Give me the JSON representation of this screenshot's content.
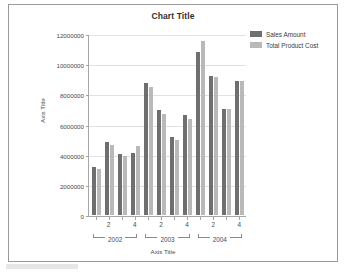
{
  "chart_data": {
    "type": "bar",
    "title": "Chart Title",
    "xlabel": "Axis Title",
    "ylabel": "Axis Title",
    "ylim": [
      0,
      12000000
    ],
    "ytick_values": [
      0,
      2000000,
      4000000,
      6000000,
      8000000,
      10000000,
      12000000
    ],
    "ytick_labels": [
      "0",
      "2000000",
      "4000000",
      "6000000",
      "8000000",
      "10000000",
      "12000000"
    ],
    "grid": true,
    "legend_position": "top-right",
    "categories": [
      "1",
      "2",
      "3",
      "4",
      "1",
      "2",
      "3",
      "4",
      "1",
      "2",
      "3",
      "4"
    ],
    "xtick_labels": [
      "",
      "2",
      "",
      "4",
      "",
      "2",
      "",
      "4",
      "",
      "2",
      "",
      "4"
    ],
    "group_labels": [
      "2002",
      "2003",
      "2004"
    ],
    "group_sizes": [
      4,
      4,
      4
    ],
    "series": [
      {
        "name": "Sales Amount",
        "color": "#6f6f6f",
        "values": [
          3200000,
          4850000,
          4050000,
          4120000,
          8820000,
          7030000,
          5210000,
          6700000,
          10870000,
          9240000,
          7060000,
          8910000
        ]
      },
      {
        "name": "Total Product Cost",
        "color": "#b9b9b9",
        "values": [
          3060000,
          4650000,
          3950000,
          4570000,
          8560000,
          6730000,
          5020000,
          6380000,
          11570000,
          9230000,
          7040000,
          8960000
        ]
      }
    ]
  },
  "legend": {
    "items": [
      {
        "label": "Sales Amount",
        "color": "#6f6f6f"
      },
      {
        "label": "Total Product Cost",
        "color": "#b9b9b9"
      }
    ]
  }
}
